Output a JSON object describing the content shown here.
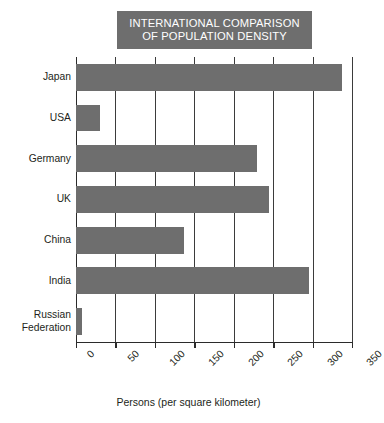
{
  "chart_data": {
    "type": "bar",
    "orientation": "horizontal",
    "title": "INTERNATIONAL COMPARISON OF POPULATION DENSITY",
    "title_lines": [
      "INTERNATIONAL COMPARISON",
      "OF POPULATION DENSITY"
    ],
    "categories": [
      "Japan",
      "USA",
      "Germany",
      "UK",
      "China",
      "India",
      "Russian Federation"
    ],
    "category_labels": [
      "Japan",
      "USA",
      "Germany",
      "UK",
      "China",
      "India",
      "Russian\nFederation"
    ],
    "values": [
      337,
      31,
      230,
      245,
      137,
      295,
      8
    ],
    "xlabel": "Persons (per square kilometer)",
    "ylabel": "",
    "xlim": [
      0,
      350
    ],
    "xticks": [
      0,
      50,
      100,
      150,
      200,
      250,
      300,
      350
    ],
    "xtick_labels": [
      "0",
      "50",
      "100",
      "150",
      "200",
      "250",
      "300",
      "350"
    ],
    "grid": true,
    "grid_axis": "x",
    "legend": false,
    "bar_color": "#6e6e6e",
    "title_box_color": "#6e6e6e",
    "title_text_color": "#ffffff",
    "axis_color": "#2b2b2b",
    "background_color": "#ffffff"
  }
}
